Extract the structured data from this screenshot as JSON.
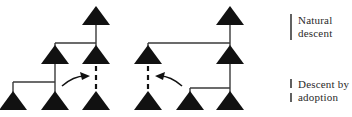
{
  "figure": {
    "type": "kinship-descent-diagram",
    "background_color": "#ffffff",
    "line_color": "#3a3a3a",
    "symbol_color": "#111111"
  },
  "legend": {
    "items": [
      {
        "key": "natural",
        "marker": "solid-vertical-line",
        "line_style": "solid",
        "label_line_1": "Natural",
        "label_line_2": "descent",
        "label": "Natural descent"
      },
      {
        "key": "adoption",
        "marker": "dashed-vertical-line",
        "line_style": "dashed",
        "label_line_1": "Descent by",
        "label_line_2": "adoption",
        "label": "Descent by adoption"
      }
    ]
  },
  "diagrams": [
    {
      "name": "left-genealogy",
      "nodes": [
        {
          "id": "L-top",
          "symbol": "triangle",
          "x": 96,
          "y": 25,
          "generation": 1
        },
        {
          "id": "L-g2-a",
          "symbol": "triangle",
          "x": 55,
          "y": 64,
          "generation": 2
        },
        {
          "id": "L-g2-b",
          "symbol": "triangle",
          "x": 96,
          "y": 64,
          "generation": 2
        },
        {
          "id": "L-g3-a",
          "symbol": "triangle",
          "x": 13,
          "y": 110,
          "generation": 3
        },
        {
          "id": "L-g3-b",
          "symbol": "triangle",
          "x": 55,
          "y": 110,
          "generation": 3
        },
        {
          "id": "L-g3-c",
          "symbol": "triangle",
          "x": 96,
          "y": 110,
          "generation": 3
        }
      ],
      "links": [
        {
          "from": "L-top",
          "to": "L-g2-a",
          "style": "solid"
        },
        {
          "from": "L-top",
          "to": "L-g2-b",
          "style": "solid"
        },
        {
          "from": "L-g2-a",
          "to": "L-g3-a",
          "style": "solid"
        },
        {
          "from": "L-g2-a",
          "to": "L-g3-b",
          "style": "solid"
        },
        {
          "from": "L-g2-b",
          "to": "L-g3-c",
          "style": "dashed"
        }
      ],
      "arrow": {
        "direction": "right",
        "from_x": 62,
        "to_x": 88,
        "y": 82
      }
    },
    {
      "name": "right-genealogy",
      "nodes": [
        {
          "id": "R-top",
          "symbol": "triangle",
          "x": 230,
          "y": 25,
          "generation": 1
        },
        {
          "id": "R-g2-a",
          "symbol": "triangle",
          "x": 148,
          "y": 64,
          "generation": 2
        },
        {
          "id": "R-g2-b",
          "symbol": "triangle",
          "x": 230,
          "y": 64,
          "generation": 2
        },
        {
          "id": "R-g3-a",
          "symbol": "triangle",
          "x": 148,
          "y": 110,
          "generation": 3
        },
        {
          "id": "R-g3-b",
          "symbol": "triangle",
          "x": 190,
          "y": 110,
          "generation": 3
        },
        {
          "id": "R-g3-c",
          "symbol": "triangle",
          "x": 230,
          "y": 110,
          "generation": 3
        }
      ],
      "links": [
        {
          "from": "R-top",
          "to": "R-g2-a",
          "style": "solid"
        },
        {
          "from": "R-top",
          "to": "R-g2-b",
          "style": "solid"
        },
        {
          "from": "R-g2-b",
          "to": "R-g3-b",
          "style": "solid"
        },
        {
          "from": "R-g2-b",
          "to": "R-g3-c",
          "style": "solid"
        },
        {
          "from": "R-g2-a",
          "to": "R-g3-a",
          "style": "dashed"
        }
      ],
      "arrow": {
        "direction": "left",
        "from_x": 182,
        "to_x": 156,
        "y": 82
      }
    }
  ]
}
